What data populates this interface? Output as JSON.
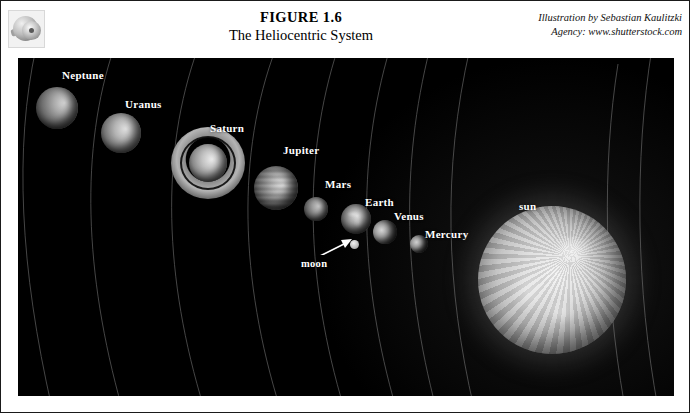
{
  "page": {
    "thumbnail_icon": "disc-thumbnail-icon"
  },
  "header": {
    "figure_number": "FIGURE 1.6",
    "figure_title": "The Heliocentric System",
    "credit_line_1": "Illustration by Sebastian Kaulitzki",
    "credit_line_2": "Agency: www.shutterstock.com"
  },
  "illustration": {
    "background_color": "#000000",
    "label_color": "#ffffff",
    "orbit_line_color": "#8f8f8f",
    "bodies": [
      {
        "name": "Neptune",
        "label": "Neptune",
        "label_x": 44,
        "label_y": 11,
        "cx": 39,
        "cy": 50,
        "r": 21
      },
      {
        "name": "Uranus",
        "label": "Uranus",
        "label_x": 107,
        "label_y": 40,
        "cx": 103,
        "cy": 75,
        "r": 20
      },
      {
        "name": "Saturn",
        "label": "Saturn",
        "label_x": 192,
        "label_y": 64,
        "cx": 190,
        "cy": 105,
        "r": 19
      },
      {
        "name": "Jupiter",
        "label": "Jupiter",
        "label_x": 265,
        "label_y": 86,
        "cx": 258,
        "cy": 130,
        "r": 22
      },
      {
        "name": "Mars",
        "label": "Mars",
        "label_x": 307,
        "label_y": 120,
        "cx": 298,
        "cy": 151,
        "r": 12
      },
      {
        "name": "Earth",
        "label": "Earth",
        "label_x": 347,
        "label_y": 138,
        "cx": 338,
        "cy": 161,
        "r": 15
      },
      {
        "name": "moon",
        "label": "moon",
        "label_x": 283,
        "label_y": 206,
        "cx": 336,
        "cy": 186,
        "r": 4
      },
      {
        "name": "Venus",
        "label": "Venus",
        "label_x": 376,
        "label_y": 152,
        "cx": 367,
        "cy": 174,
        "r": 12
      },
      {
        "name": "Mercury",
        "label": "Mercury",
        "label_x": 407,
        "label_y": 170,
        "cx": 401,
        "cy": 186,
        "r": 9
      },
      {
        "name": "sun",
        "label": "sun",
        "label_x": 501,
        "label_y": 142,
        "cx": 534,
        "cy": 222,
        "r": 74
      }
    ],
    "orbit_count": 9
  }
}
